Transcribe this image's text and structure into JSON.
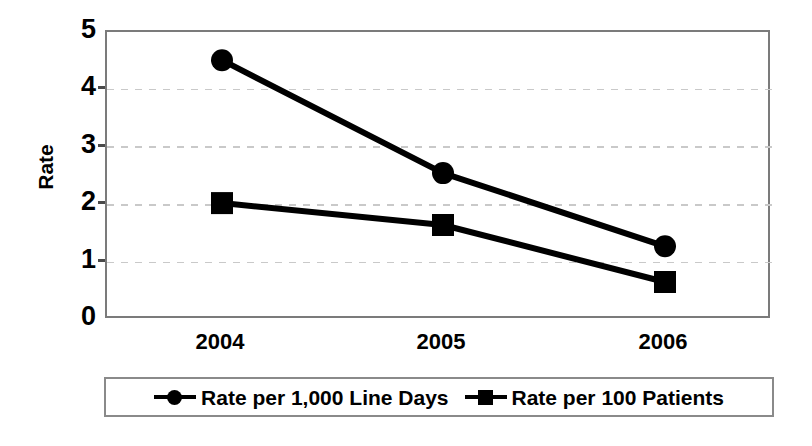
{
  "chart_data": {
    "type": "line",
    "title": "",
    "xlabel": "",
    "ylabel": "Rate",
    "categories": [
      "2004",
      "2005",
      "2006"
    ],
    "ylim": [
      0,
      5
    ],
    "yticks": [
      0,
      1,
      2,
      3,
      4,
      5
    ],
    "ytick_labels": [
      "0",
      "1",
      "2",
      "3",
      "4",
      "5"
    ],
    "grid": "horizontal-dashed",
    "legend_position": "bottom",
    "series": [
      {
        "name": "Rate per 1,000 Line Days",
        "marker": "circle",
        "color": "#000000",
        "values": [
          4.51,
          2.55,
          1.28
        ]
      },
      {
        "name": "Rate per 100 Patients",
        "marker": "square",
        "color": "#000000",
        "values": [
          2.03,
          1.65,
          0.66
        ]
      }
    ]
  },
  "axes": {
    "y_title": "Rate",
    "y_ticks": [
      "5",
      "4",
      "3",
      "2",
      "1",
      "0"
    ],
    "x_ticks": [
      "2004",
      "2005",
      "2006"
    ]
  },
  "legend": {
    "items": [
      {
        "label": "Rate per 1,000 Line Days",
        "marker": "circle-marker-icon"
      },
      {
        "label": "Rate per 100 Patients",
        "marker": "square-marker-icon"
      }
    ]
  },
  "colors": {
    "series": "#000000",
    "gridline": "#c9c9c9",
    "plot_border": "#7b7b7b",
    "background": "#ffffff"
  }
}
